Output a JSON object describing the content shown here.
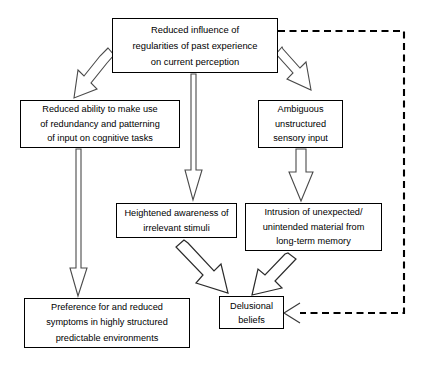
{
  "diagram": {
    "background_color": "#ffffff",
    "box_border_color": "#000000",
    "arrow_outline_color": "#4a4a4a",
    "feedback_line_color": "#000000",
    "nodes": [
      {
        "id": "reduced-influence",
        "lines": [
          "Reduced influence of",
          "regularities of past experience",
          "on current perception"
        ]
      },
      {
        "id": "reduced-ability",
        "lines": [
          "Reduced ability to make use",
          "of redundancy and patterning",
          "of input on cognitive tasks"
        ]
      },
      {
        "id": "ambiguous-input",
        "lines": [
          "Ambiguous",
          "unstructured",
          "sensory input"
        ]
      },
      {
        "id": "heightened-awareness",
        "lines": [
          "Heightened awareness of",
          "irrelevant stimuli"
        ]
      },
      {
        "id": "intrusion",
        "lines": [
          "Intrusion of unexpected/",
          "unintended material from",
          "long-term memory"
        ]
      },
      {
        "id": "preference",
        "lines": [
          "Preference for and reduced",
          "symptoms in highly structured",
          "predictable environments"
        ]
      },
      {
        "id": "delusional-beliefs",
        "lines": [
          "Delusional",
          "beliefs"
        ]
      }
    ],
    "edges": [
      {
        "id": "influence-to-ability",
        "from": "reduced-influence",
        "to": "reduced-ability",
        "style": "hollow-block-arrow",
        "direction": "diagonal-down-left"
      },
      {
        "id": "influence-to-ambiguous",
        "from": "reduced-influence",
        "to": "ambiguous-input",
        "style": "hollow-block-arrow",
        "direction": "diagonal-down-right"
      },
      {
        "id": "influence-to-heightened",
        "from": "reduced-influence",
        "to": "heightened-awareness",
        "style": "hollow-block-arrow",
        "direction": "down"
      },
      {
        "id": "ability-to-preference",
        "from": "reduced-ability",
        "to": "preference",
        "style": "hollow-block-arrow",
        "direction": "down"
      },
      {
        "id": "ambiguous-to-intrusion",
        "from": "ambiguous-input",
        "to": "intrusion",
        "style": "hollow-block-arrow",
        "direction": "down"
      },
      {
        "id": "heightened-to-delusional",
        "from": "heightened-awareness",
        "to": "delusional-beliefs",
        "style": "hollow-block-arrow",
        "direction": "diagonal-down-right"
      },
      {
        "id": "intrusion-to-delusional",
        "from": "intrusion",
        "to": "delusional-beliefs",
        "style": "hollow-block-arrow",
        "direction": "diagonal-down-left"
      },
      {
        "id": "delusional-feedback-to-influence",
        "from": "reduced-influence",
        "to": "delusional-beliefs",
        "style": "dashed-line-open-arrow",
        "direction": "right-down-left"
      }
    ]
  }
}
